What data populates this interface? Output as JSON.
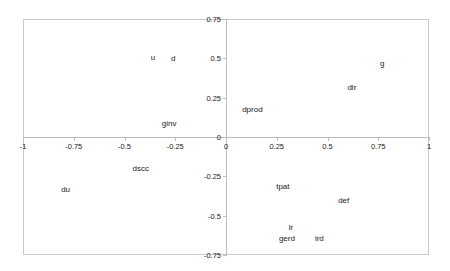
{
  "chart_data": {
    "type": "scatter",
    "title": "",
    "subtitle": "",
    "xlabel": "",
    "ylabel": "",
    "xlim": [
      -1,
      1
    ],
    "ylim": [
      -0.75,
      0.75
    ],
    "grid": false,
    "legend": "none",
    "marker_style": "text-label-only",
    "x_ticks": [
      {
        "value": -1,
        "label": "-1"
      },
      {
        "value": -0.75,
        "label": "-0.75"
      },
      {
        "value": -0.5,
        "label": "-0.5"
      },
      {
        "value": -0.25,
        "label": "-0.25"
      },
      {
        "value": 0,
        "label": "0"
      },
      {
        "value": 0.25,
        "label": "0.25"
      },
      {
        "value": 0.5,
        "label": "0.5"
      },
      {
        "value": 0.75,
        "label": "0.75"
      },
      {
        "value": 1,
        "label": "1"
      }
    ],
    "y_ticks": [
      {
        "value": 0.75,
        "label": "0.75"
      },
      {
        "value": 0.5,
        "label": "0.5"
      },
      {
        "value": 0.25,
        "label": "0.25"
      },
      {
        "value": 0,
        "label": "0"
      },
      {
        "value": -0.25,
        "label": "-0.25"
      },
      {
        "value": -0.5,
        "label": "-0.5"
      },
      {
        "value": -0.75,
        "label": "-0.75"
      }
    ],
    "points": [
      {
        "label": "u",
        "x": -0.36,
        "y": 0.51
      },
      {
        "label": "d",
        "x": -0.26,
        "y": 0.5
      },
      {
        "label": "ginv",
        "x": -0.28,
        "y": 0.09
      },
      {
        "label": "dprod",
        "x": 0.13,
        "y": 0.18
      },
      {
        "label": "dlr",
        "x": 0.62,
        "y": 0.32
      },
      {
        "label": "g",
        "x": 0.77,
        "y": 0.47
      },
      {
        "label": "dscc",
        "x": -0.42,
        "y": -0.2
      },
      {
        "label": "du",
        "x": -0.79,
        "y": -0.33
      },
      {
        "label": "tpat",
        "x": 0.28,
        "y": -0.31
      },
      {
        "label": "def",
        "x": 0.58,
        "y": -0.4
      },
      {
        "label": "lr",
        "x": 0.32,
        "y": -0.57
      },
      {
        "label": "gerd",
        "x": 0.3,
        "y": -0.64
      },
      {
        "label": "lrd",
        "x": 0.46,
        "y": -0.64
      }
    ]
  },
  "colors": {
    "frame": "#c9c9c9",
    "axis": "#bdbdbd",
    "text": "#1a1a1a",
    "background": "#ffffff"
  }
}
